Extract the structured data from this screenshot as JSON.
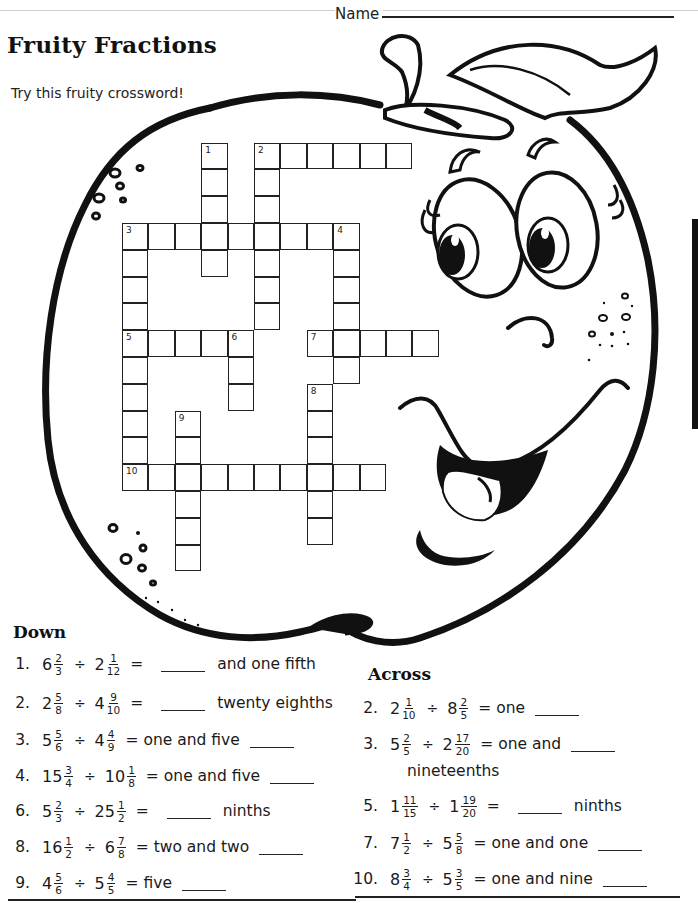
{
  "header": {
    "name_label": "Name",
    "title": "Fruity Fractions",
    "subtitle": "Try this fruity crossword!"
  },
  "crossword": {
    "numbers": {
      "1": "1",
      "2": "2",
      "3": "3",
      "4": "4",
      "5": "5",
      "6": "6",
      "7": "7",
      "8": "8",
      "9": "9",
      "10": "10"
    }
  },
  "down": {
    "heading": "Down",
    "clues": [
      {
        "num": "1.",
        "a_whole": "6",
        "a_num": "2",
        "a_den": "3",
        "op": "÷",
        "b_whole": "2",
        "b_num": "1",
        "b_den": "12",
        "eq": "=",
        "pre": "",
        "post": "and one fifth"
      },
      {
        "num": "2.",
        "a_whole": "2",
        "a_num": "5",
        "a_den": "8",
        "op": "÷",
        "b_whole": "4",
        "b_num": "9",
        "b_den": "10",
        "eq": "=",
        "pre": "",
        "post": "twenty eighths"
      },
      {
        "num": "3.",
        "a_whole": "5",
        "a_num": "5",
        "a_den": "6",
        "op": "÷",
        "b_whole": "4",
        "b_num": "4",
        "b_den": "9",
        "eq": "=",
        "pre": "one and five",
        "post": ""
      },
      {
        "num": "4.",
        "a_whole": "15",
        "a_num": "3",
        "a_den": "4",
        "op": "÷",
        "b_whole": "10",
        "b_num": "1",
        "b_den": "8",
        "eq": "=",
        "pre": "one and five",
        "post": ""
      },
      {
        "num": "6.",
        "a_whole": "5",
        "a_num": "2",
        "a_den": "3",
        "op": "÷",
        "b_whole": "25",
        "b_num": "1",
        "b_den": "2",
        "eq": "=",
        "pre": "",
        "post": "ninths"
      },
      {
        "num": "8.",
        "a_whole": "16",
        "a_num": "1",
        "a_den": "2",
        "op": "÷",
        "b_whole": "6",
        "b_num": "7",
        "b_den": "8",
        "eq": "=",
        "pre": "two and two",
        "post": ""
      },
      {
        "num": "9.",
        "a_whole": "4",
        "a_num": "5",
        "a_den": "6",
        "op": "÷",
        "b_whole": "5",
        "b_num": "4",
        "b_den": "5",
        "eq": "=",
        "pre": "five",
        "post": ""
      }
    ]
  },
  "across": {
    "heading": "Across",
    "clues": [
      {
        "num": "2.",
        "a_whole": "2",
        "a_num": "1",
        "a_den": "10",
        "op": "÷",
        "b_whole": "8",
        "b_num": "2",
        "b_den": "5",
        "eq": "=",
        "pre": "one",
        "post": ""
      },
      {
        "num": "3.",
        "a_whole": "5",
        "a_num": "2",
        "a_den": "5",
        "op": "÷",
        "b_whole": "2",
        "b_num": "17",
        "b_den": "20",
        "eq": "=",
        "pre": "one and",
        "post": "",
        "continuation": "nineteenths"
      },
      {
        "num": "5.",
        "a_whole": "1",
        "a_num": "11",
        "a_den": "15",
        "op": "÷",
        "b_whole": "1",
        "b_num": "19",
        "b_den": "20",
        "eq": "=",
        "pre": "",
        "post": "ninths"
      },
      {
        "num": "7.",
        "a_whole": "7",
        "a_num": "1",
        "a_den": "2",
        "op": "÷",
        "b_whole": "5",
        "b_num": "5",
        "b_den": "8",
        "eq": "=",
        "pre": "one and one",
        "post": ""
      },
      {
        "num": "10.",
        "a_whole": "8",
        "a_num": "3",
        "a_den": "4",
        "op": "÷",
        "b_whole": "5",
        "b_num": "3",
        "b_den": "5",
        "eq": "=",
        "pre": "one and nine",
        "post": ""
      }
    ]
  }
}
